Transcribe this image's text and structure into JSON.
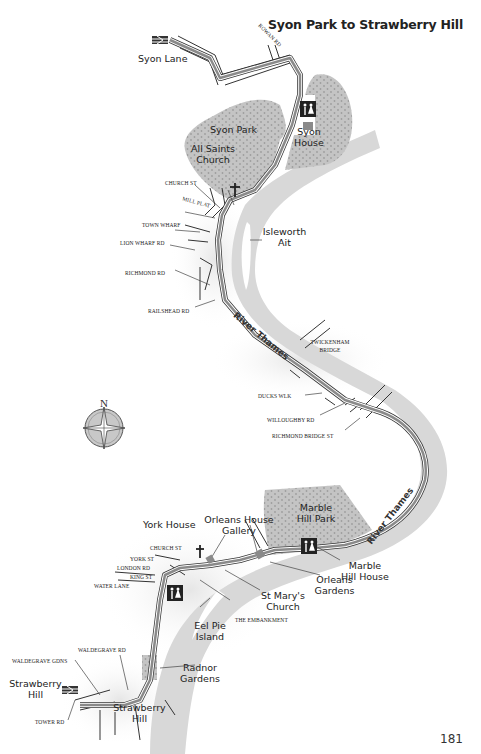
{
  "page": {
    "title": "Syon Park to Strawberry Hill",
    "page_number": "181"
  },
  "compass": {
    "north_label": "N"
  },
  "places": {
    "syon_lane": "Syon Lane",
    "syon_park": "Syon Park",
    "syon_house": "Syon House",
    "all_saints_church": "All Saints Church",
    "isleworth_ait": "Isleworth Ait",
    "york_house": "York House",
    "orleans_house_gallery": "Orleans House Gallery",
    "marble_hill_park": "Marble Hill Park",
    "marble_hill_house": "Marble Hill House",
    "orleans_gardens": "Orleans Gardens",
    "st_marys_church": "St Mary's Church",
    "eel_pie_island": "Eel Pie Island",
    "radnor_gardens": "Radnor Gardens",
    "strawberry_hill_station": "Strawberry Hill",
    "strawberry_hill": "Strawberry Hill"
  },
  "rivers": {
    "thames_upper": "River Thames",
    "thames_lower": "River Thames"
  },
  "roads": {
    "rowan_rd": "Rowan Rd",
    "church_st_isleworth": "Church St",
    "mill_plat": "Mill Plat",
    "town_wharf": "Town Wharf",
    "lion_wharf_rd": "Lion Wharf Rd",
    "richmond_rd": "Richmond Rd",
    "railshead_rd": "Railshead Rd",
    "twickenham_bridge": "Twickenham Bridge",
    "ducks_wlk": "Ducks Wlk",
    "willoughby_rd": "Willoughby Rd",
    "richmond_bridge_st": "Richmond Bridge St",
    "church_st_twickenham": "Church St",
    "york_st": "York St",
    "london_rd": "London Rd",
    "king_st": "King St",
    "water_lane": "Water Lane",
    "the_embankment": "The Embankment",
    "waldegrave_rd": "Waldegrave Rd",
    "waldegrave_gdns": "Waldegrave Gdns",
    "tower_rd": "Tower Rd"
  },
  "colors": {
    "river": "#d6d6d6",
    "park": "#bdbdbd",
    "route": "#8a8a8a",
    "road_outline": "#333333",
    "text": "#222222"
  }
}
